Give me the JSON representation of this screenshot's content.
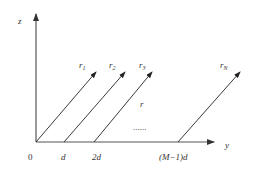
{
  "diagram": {
    "axes": {
      "vertical_label": "z",
      "horizontal_label": "y",
      "axis_color": "#555555"
    },
    "rays": [
      {
        "label": "r",
        "subscript": "1",
        "start_x": 36,
        "end": [
          96,
          72
        ]
      },
      {
        "label": "r",
        "subscript": "2",
        "start_x": 64,
        "end": [
          125,
          72
        ]
      },
      {
        "label": "r",
        "subscript": "3",
        "start_x": 94,
        "end": [
          152,
          72
        ]
      },
      {
        "label": "r",
        "subscript": "N",
        "start_x": 178,
        "end": [
          240,
          72
        ]
      }
    ],
    "middle_label": "r",
    "ellipsis": "......",
    "ticks": [
      {
        "label": "0",
        "x": 31
      },
      {
        "label": "d",
        "x": 63
      },
      {
        "label": "2d",
        "x": 97
      },
      {
        "label": "(M−1)d",
        "x": 178
      }
    ]
  }
}
